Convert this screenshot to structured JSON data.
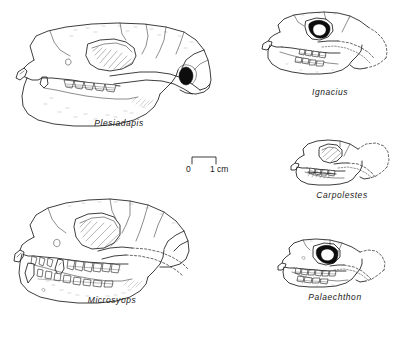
{
  "plate": {
    "background_color": "#ffffff",
    "ink_color": "#1b1b1b",
    "width": 406,
    "height": 337
  },
  "scale": {
    "zero_label": "0",
    "unit_label": "1 cm",
    "bar_length_px": 24
  },
  "specimens": [
    {
      "id": "plesiadapis",
      "label": "Plesiadapis",
      "column": "left",
      "order": 1
    },
    {
      "id": "microsyops",
      "label": "Microsyops",
      "column": "left",
      "order": 2
    },
    {
      "id": "ignacius",
      "label": "Ignacius",
      "column": "right",
      "order": 1
    },
    {
      "id": "carpolestes",
      "label": "Carpolestes",
      "column": "right",
      "order": 2
    },
    {
      "id": "palaechthon",
      "label": "Palaechthon",
      "column": "right",
      "order": 3
    }
  ]
}
